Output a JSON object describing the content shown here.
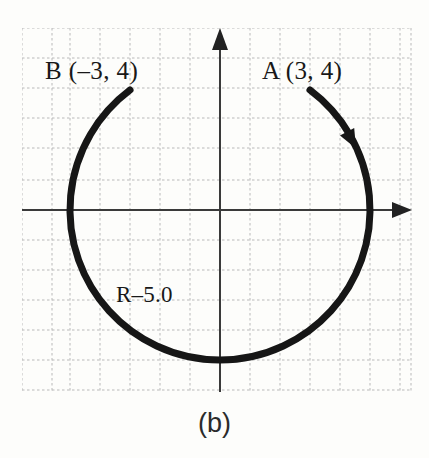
{
  "figure": {
    "caption": "(b)",
    "background_color": "#fdfdfb",
    "ink_color": "#181818",
    "grid_color": "#b9b9b9"
  },
  "labels": {
    "point_b": "B (–3, 4)",
    "point_a": "A (3, 4)",
    "radius": "R–5.0"
  },
  "chart_data": {
    "type": "scatter",
    "title": "(b)",
    "xlabel": "",
    "ylabel": "",
    "grid": true,
    "grid_style": "dotted",
    "grid_spacing_units": 1,
    "xlim": [
      -6.6,
      6.9
    ],
    "ylim": [
      -5.0,
      6.1
    ],
    "origin_px": [
      220,
      210
    ],
    "units_per_cell": 1,
    "px_per_unit": 30,
    "axes": {
      "x_axis": {
        "from_px": [
          22,
          210
        ],
        "to_px": [
          412,
          210
        ],
        "arrow": "right",
        "color": "#303030"
      },
      "y_axis": {
        "from_px": [
          220,
          392
        ],
        "to_px": [
          220,
          28
        ],
        "arrow": "up",
        "color": "#303030"
      }
    },
    "circle": {
      "center": [
        0,
        0
      ],
      "radius": 5.0,
      "radius_label": "R–5.0"
    },
    "arc": {
      "description": "Clockwise arc from A(3,4) sweeping the long way around through right, bottom and left to B(-3,4)",
      "start_point": {
        "name": "A",
        "x": 3,
        "y": 4
      },
      "end_point": {
        "name": "B",
        "x": -3,
        "y": 4
      },
      "direction": "clockwise",
      "sweep_degrees": 307,
      "stroke_width_px": 7,
      "color": "#161616",
      "arrowhead_at": {
        "x": 4.4,
        "y": 2.3,
        "angle_deg": 62
      }
    },
    "annotations": [
      {
        "text": "B (–3, 4)",
        "x": -5.8,
        "y": 4.8
      },
      {
        "text": "A (3, 4)",
        "x": 1.4,
        "y": 4.8
      },
      {
        "text": "R–5.0",
        "x": -3.45,
        "y": -2.6
      }
    ]
  }
}
